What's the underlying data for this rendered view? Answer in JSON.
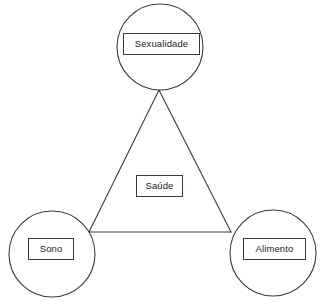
{
  "diagram": {
    "type": "triangle-relationship",
    "background_color": "#ffffff",
    "stroke_color": "#3a3a3a",
    "text_color": "#1c1c1c",
    "center": {
      "id": "saude",
      "label": "Saúde"
    },
    "nodes": [
      {
        "id": "sexualidade",
        "label": "Sexualidade",
        "position": "top",
        "circle": {
          "cx": 160,
          "cy": 47,
          "r": 43
        }
      },
      {
        "id": "sono",
        "label": "Sono",
        "position": "bottom-left",
        "circle": {
          "cx": 52,
          "cy": 254,
          "r": 43
        }
      },
      {
        "id": "alimento",
        "label": "Alimento",
        "position": "bottom-right",
        "circle": {
          "cx": 273,
          "cy": 253,
          "r": 43
        }
      }
    ],
    "triangle": {
      "apex": {
        "x": 159,
        "y": 90
      },
      "bottom_left": {
        "x": 89,
        "y": 232
      },
      "bottom_right": {
        "x": 231,
        "y": 232
      }
    },
    "edges": [
      {
        "from": "sexualidade",
        "to": "sono"
      },
      {
        "from": "sexualidade",
        "to": "alimento"
      },
      {
        "from": "sono",
        "to": "alimento"
      }
    ]
  }
}
